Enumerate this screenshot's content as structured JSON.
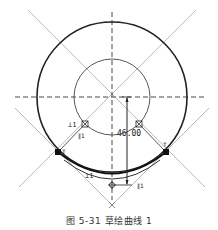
{
  "figure": {
    "caption": "图 5-31  草绘曲线 1",
    "dimension_label": "46.00",
    "tangent_point_labels": [
      "T",
      "T"
    ],
    "constraint_labels": {
      "perpendicular_upper": "⊥1",
      "parallel_upper": "∥1",
      "perpendicular_lower": "⊥1",
      "parallel_lower": "∥1"
    }
  },
  "colors": {
    "stroke_dark": "#222222",
    "stroke_light": "#9a9a9a",
    "background": "#ffffff"
  }
}
